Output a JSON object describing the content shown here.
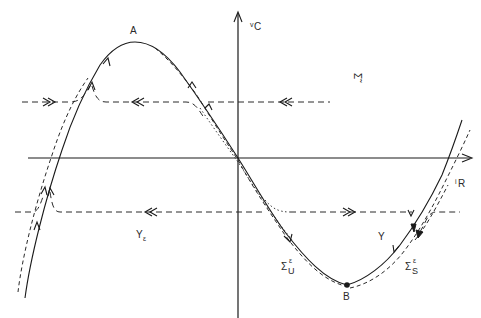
{
  "figure": {
    "axes": {
      "x_label_main": "i",
      "x_label_sub": "R",
      "y_label_main": "v",
      "y_label_sub": "C"
    },
    "points": {
      "maximum": "A",
      "minimum": "B"
    },
    "regions": {
      "sigma_tilde": "Σ̃",
      "upsilon": "Y",
      "upsilon_eps_main": "Y",
      "upsilon_eps_sub": "ε"
    },
    "manifolds": {
      "unstable_main": "Σ",
      "unstable_sup": "ε",
      "unstable_sub": "U",
      "stable_main": "Σ",
      "stable_sup": "ε",
      "stable_sub": "S"
    },
    "colors": {
      "ink": "#1a1a1a",
      "background": "#ffffff"
    }
  }
}
